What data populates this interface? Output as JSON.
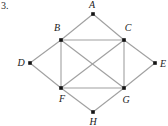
{
  "figure": {
    "problem_number": "3.",
    "background_color": "#ffffff",
    "edge_color": "#a0a0a0",
    "vertex_color": "#141414",
    "label_color": "#1a1a1a"
  },
  "graph_data": {
    "type": "undirected-graph",
    "vertex_count": 8,
    "edge_count": 14,
    "vertices": [
      {
        "id": "A",
        "label": "A",
        "x": 93,
        "y": 14,
        "label_x": 92,
        "label_y": 5,
        "degree": 2
      },
      {
        "id": "B",
        "label": "B",
        "x": 61,
        "y": 40,
        "label_x": 57,
        "label_y": 28,
        "degree": 5
      },
      {
        "id": "C",
        "label": "C",
        "x": 124,
        "y": 40,
        "label_x": 128,
        "label_y": 28,
        "degree": 5
      },
      {
        "id": "D",
        "label": "D",
        "x": 30,
        "y": 63,
        "label_x": 21,
        "label_y": 63,
        "degree": 2
      },
      {
        "id": "E",
        "label": "E",
        "x": 155,
        "y": 63,
        "label_x": 163,
        "label_y": 64,
        "degree": 2
      },
      {
        "id": "F",
        "label": "F",
        "x": 61,
        "y": 88,
        "label_x": 62,
        "label_y": 99,
        "degree": 5
      },
      {
        "id": "G",
        "label": "G",
        "x": 124,
        "y": 88,
        "label_x": 126,
        "label_y": 100,
        "degree": 5
      },
      {
        "id": "H",
        "label": "H",
        "x": 93,
        "y": 112,
        "label_x": 93,
        "label_y": 122,
        "degree": 2
      }
    ],
    "edges": [
      {
        "from": "A",
        "to": "B"
      },
      {
        "from": "A",
        "to": "C"
      },
      {
        "from": "B",
        "to": "C"
      },
      {
        "from": "B",
        "to": "D"
      },
      {
        "from": "B",
        "to": "F"
      },
      {
        "from": "B",
        "to": "G"
      },
      {
        "from": "C",
        "to": "E"
      },
      {
        "from": "C",
        "to": "F"
      },
      {
        "from": "C",
        "to": "G"
      },
      {
        "from": "D",
        "to": "F"
      },
      {
        "from": "E",
        "to": "G"
      },
      {
        "from": "F",
        "to": "G"
      },
      {
        "from": "F",
        "to": "H"
      },
      {
        "from": "G",
        "to": "H"
      }
    ]
  }
}
